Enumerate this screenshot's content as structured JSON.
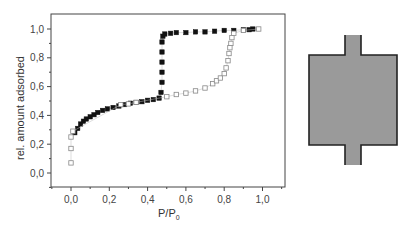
{
  "chart_data": {
    "type": "scatter",
    "title": "",
    "xlabel": "P/P",
    "xlabel_subscript": "0",
    "ylabel": "rel. amount adsorbed",
    "xlim": [
      -0.1,
      1.12
    ],
    "ylim": [
      -0.1,
      1.1
    ],
    "xticks": [
      0.0,
      0.2,
      0.4,
      0.6,
      0.8,
      1.0
    ],
    "xtick_labels": [
      "0,0",
      "0,2",
      "0,4",
      "0,6",
      "0,8",
      "1,0"
    ],
    "yticks": [
      0.0,
      0.2,
      0.4,
      0.6,
      0.8,
      1.0
    ],
    "ytick_labels": [
      "0,0",
      "0,2",
      "0,4",
      "0,6",
      "0,8",
      "1,0"
    ],
    "grid": false,
    "legend": null,
    "series": [
      {
        "name": "adsorption (filled)",
        "marker": "filled-square",
        "color": "#111111",
        "x": [
          0.02,
          0.035,
          0.05,
          0.065,
          0.08,
          0.1,
          0.12,
          0.14,
          0.165,
          0.19,
          0.22,
          0.25,
          0.28,
          0.31,
          0.34,
          0.37,
          0.4,
          0.43,
          0.46,
          0.47,
          0.475,
          0.475,
          0.475,
          0.475,
          0.475,
          0.48,
          0.49,
          0.52,
          0.55,
          0.6,
          0.65,
          0.7,
          0.75,
          0.8,
          0.85,
          0.9,
          0.93,
          0.95
        ],
        "y": [
          0.28,
          0.31,
          0.34,
          0.36,
          0.375,
          0.39,
          0.405,
          0.42,
          0.435,
          0.445,
          0.455,
          0.465,
          0.475,
          0.485,
          0.49,
          0.495,
          0.505,
          0.51,
          0.52,
          0.56,
          0.63,
          0.7,
          0.77,
          0.84,
          0.91,
          0.95,
          0.965,
          0.97,
          0.975,
          0.975,
          0.98,
          0.98,
          0.985,
          0.99,
          0.99,
          0.995,
          0.995,
          1.0
        ]
      },
      {
        "name": "desorption (open)",
        "marker": "open-square",
        "color": "#888888",
        "x": [
          0.0,
          0.0,
          0.0,
          0.01,
          0.26,
          0.3,
          0.34,
          0.5,
          0.55,
          0.6,
          0.65,
          0.7,
          0.74,
          0.76,
          0.78,
          0.8,
          0.81,
          0.82,
          0.825,
          0.83,
          0.835,
          0.84,
          0.85,
          0.9,
          0.98
        ],
        "y": [
          0.07,
          0.17,
          0.25,
          0.29,
          0.475,
          0.48,
          0.49,
          0.53,
          0.545,
          0.555,
          0.57,
          0.59,
          0.62,
          0.64,
          0.66,
          0.69,
          0.73,
          0.78,
          0.83,
          0.87,
          0.9,
          0.94,
          0.97,
          0.99,
          1.0
        ]
      }
    ]
  },
  "diagram": {
    "name": "ink-bottle pore",
    "fill": "#9a9a9a",
    "stroke": "#222222"
  }
}
